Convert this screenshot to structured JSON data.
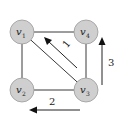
{
  "diagram": {
    "nodes": [
      {
        "id": "v1",
        "label": "v",
        "sub": "1"
      },
      {
        "id": "v4",
        "label": "v",
        "sub": "4"
      },
      {
        "id": "v2",
        "label": "v",
        "sub": "2"
      },
      {
        "id": "v3",
        "label": "v",
        "sub": "3"
      }
    ],
    "edges": [
      {
        "from": "v1",
        "to": "v4"
      },
      {
        "from": "v1",
        "to": "v2"
      },
      {
        "from": "v2",
        "to": "v3"
      },
      {
        "from": "v4",
        "to": "v3"
      },
      {
        "from": "v1",
        "to": "v3"
      }
    ],
    "arrows": [
      {
        "id": "arrow-1",
        "label": "1",
        "direction": "v3 to v1 (diagonal)"
      },
      {
        "id": "arrow-3",
        "label": "3",
        "direction": "upward (right side)"
      },
      {
        "id": "arrow-2",
        "label": "2",
        "direction": "leftward (bottom)"
      }
    ],
    "colors": {
      "node_fill": "#cfcfcf",
      "edge": "#3a3a3a",
      "arrow": "#111111"
    }
  }
}
